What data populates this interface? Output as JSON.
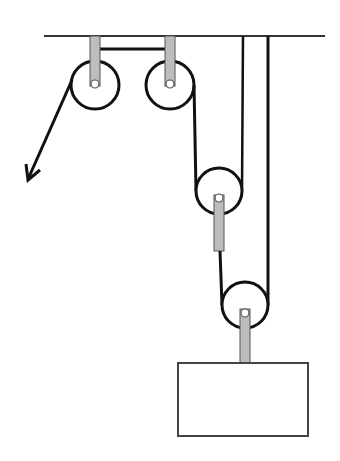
{
  "diagram": {
    "colors": {
      "line": "#111111",
      "ceiling": "#333333",
      "rod_fill": "#bdbdbd",
      "rod_stroke": "#555555",
      "box_stroke": "#444444",
      "background": "#ffffff"
    },
    "ceiling": {
      "x1": 44,
      "x2": 325,
      "y": 36
    },
    "pulleys": [
      {
        "id": "fixed-pulley-1",
        "cx": 95,
        "cy": 85,
        "r": 24,
        "type": "fixed"
      },
      {
        "id": "fixed-pulley-2",
        "cx": 170,
        "cy": 85,
        "r": 24,
        "type": "fixed"
      },
      {
        "id": "movable-pulley-1",
        "cx": 219,
        "cy": 191,
        "r": 23,
        "type": "movable"
      },
      {
        "id": "movable-pulley-2",
        "cx": 245,
        "cy": 305,
        "r": 23,
        "type": "movable"
      }
    ],
    "load": {
      "x": 178,
      "y": 363,
      "width": 130,
      "height": 73
    },
    "applied_force": {
      "from_x": 72,
      "from_y": 80,
      "to_x": 28,
      "to_y": 179,
      "direction": "down-left"
    }
  }
}
